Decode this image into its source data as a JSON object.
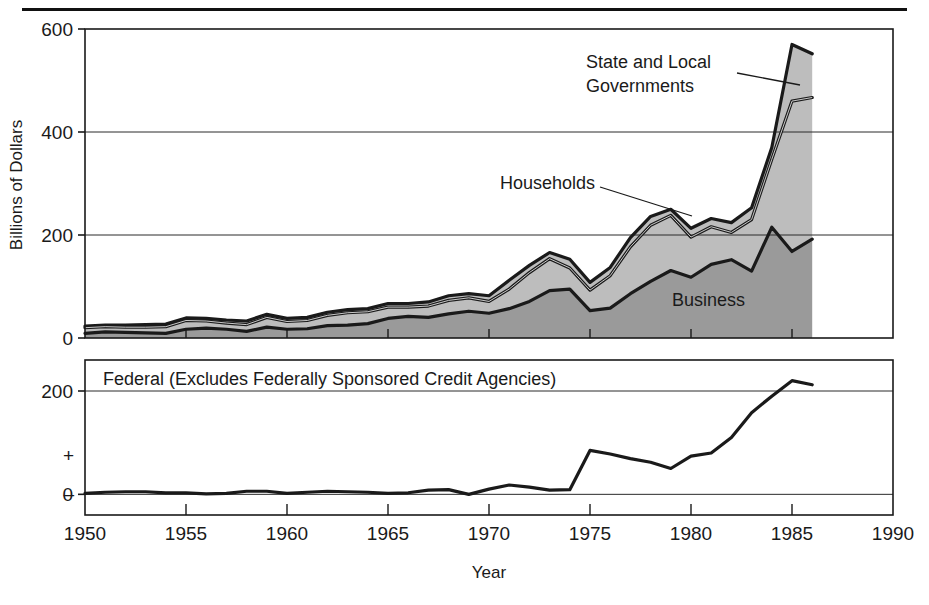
{
  "figure": {
    "ylabel": "Billions of Dollars",
    "xlabel": "Year",
    "top_rule": true
  },
  "upper_panel": {
    "y_ticks": [
      "0",
      "200",
      "400",
      "600"
    ],
    "annotations": [
      {
        "name": "state-and-local-governments",
        "line1": "State and Local",
        "line2": "Governments"
      },
      {
        "name": "households",
        "line1": "Households",
        "line2": ""
      },
      {
        "name": "business",
        "line1": "Business",
        "line2": ""
      }
    ]
  },
  "lower_panel": {
    "label": "Federal (Excludes Federally Sponsored Credit Agencies)",
    "y_ticks": [
      "0",
      "200"
    ],
    "plus_sign": "+",
    "minus_sign": "–"
  },
  "x_axis": {
    "ticks": [
      "1950",
      "1955",
      "1960",
      "1965",
      "1970",
      "1975",
      "1980",
      "1985",
      "1990"
    ],
    "min": 1950,
    "max": 1990
  },
  "colors": {
    "business_fill": "#9a9a9a",
    "households_fill": "#bdbdbd",
    "state_local_fill": "#bdbdbd",
    "line": "#1a1a1a",
    "grid": "#2a2a2a",
    "background": "#ffffff"
  },
  "chart_data": {
    "type": "area",
    "title": "",
    "subtitle": "",
    "xlabel": "Year",
    "ylabel": "Billions of Dollars",
    "xlim": [
      1950,
      1990
    ],
    "grid": true,
    "legend_position": "inline-annotations",
    "panels": [
      {
        "name": "upper",
        "type": "area",
        "stacked": true,
        "ylim": [
          0,
          600
        ],
        "yticks": [
          0,
          200,
          400,
          600
        ],
        "x": [
          1950,
          1951,
          1952,
          1953,
          1954,
          1955,
          1956,
          1957,
          1958,
          1959,
          1960,
          1961,
          1962,
          1963,
          1964,
          1965,
          1966,
          1967,
          1968,
          1969,
          1970,
          1971,
          1972,
          1973,
          1974,
          1975,
          1976,
          1977,
          1978,
          1979,
          1980,
          1981,
          1982,
          1983,
          1984,
          1985,
          1986
        ],
        "series": [
          {
            "name": "Business",
            "fill": "#9a9a9a",
            "values": [
              9,
              12,
              11,
              10,
              9,
              17,
              19,
              17,
              13,
              21,
              17,
              18,
              24,
              25,
              28,
              38,
              42,
              40,
              47,
              52,
              48,
              57,
              71,
              92,
              95,
              53,
              58,
              86,
              110,
              131,
              118,
              143,
              152,
              130,
              215,
              168,
              192
            ]
          },
          {
            "name": "Households",
            "fill": "#bdbdbd",
            "values": [
              11,
              10,
              10,
              11,
              13,
              17,
              14,
              12,
              13,
              19,
              15,
              16,
              20,
              24,
              23,
              22,
              18,
              22,
              26,
              26,
              23,
              38,
              56,
              62,
              41,
              40,
              63,
              91,
              109,
              107,
              78,
              73,
              53,
              100,
              132,
              292,
              275
            ]
          },
          {
            "name": "State and Local Governments",
            "fill": "#bdbdbd",
            "values": [
              3,
              3,
              4,
              5,
              5,
              5,
              5,
              6,
              7,
              6,
              6,
              6,
              6,
              6,
              6,
              7,
              7,
              8,
              9,
              8,
              11,
              17,
              14,
              12,
              17,
              15,
              16,
              18,
              17,
              12,
              17,
              16,
              19,
              23,
              23,
              110,
              85
            ]
          }
        ],
        "totals": [
          23,
          25,
          25,
          26,
          27,
          39,
          38,
          35,
          33,
          46,
          38,
          40,
          50,
          55,
          57,
          67,
          67,
          70,
          82,
          86,
          82,
          112,
          141,
          166,
          153,
          108,
          137,
          195,
          236,
          250,
          213,
          232,
          224,
          253,
          370,
          570,
          552
        ]
      },
      {
        "name": "lower",
        "type": "line",
        "ylim": [
          -40,
          260
        ],
        "yticks": [
          0,
          200
        ],
        "label": "Federal (Excludes Federally Sponsored Credit Agencies)",
        "x": [
          1950,
          1951,
          1952,
          1953,
          1954,
          1955,
          1956,
          1957,
          1958,
          1959,
          1960,
          1961,
          1962,
          1963,
          1964,
          1965,
          1966,
          1967,
          1968,
          1969,
          1970,
          1971,
          1972,
          1973,
          1974,
          1975,
          1976,
          1977,
          1978,
          1979,
          1980,
          1981,
          1982,
          1983,
          1984,
          1985,
          1986
        ],
        "series": [
          {
            "name": "Federal",
            "values": [
              2,
              4,
              5,
              5,
              3,
              3,
              1,
              2,
              6,
              6,
              2,
              4,
              6,
              5,
              4,
              2,
              3,
              8,
              9,
              0,
              10,
              18,
              14,
              8,
              9,
              85,
              78,
              69,
              62,
              50,
              74,
              80,
              110,
              158,
              190,
              220,
              212
            ]
          }
        ]
      }
    ]
  }
}
